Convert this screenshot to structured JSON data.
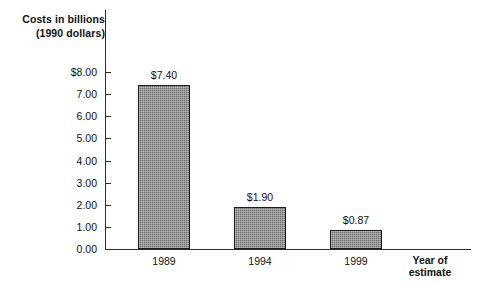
{
  "chart_data": {
    "type": "bar",
    "title": "",
    "ylabel": "Costs in billions (1990 dollars)",
    "ylabel_line1": "Costs in billions",
    "ylabel_line2": "(1990 dollars)",
    "xlabel": "Year of estimate",
    "xlabel_line1": "Year of",
    "xlabel_line2": "estimate",
    "categories": [
      "1989",
      "1994",
      "1999"
    ],
    "values": [
      7.4,
      1.9,
      0.87
    ],
    "value_labels": [
      "$7.40",
      "$1.90",
      "$0.87"
    ],
    "ylim": [
      0.0,
      8.0
    ],
    "ytick_labels": [
      "$8.00",
      "7.00",
      "6.00",
      "5.00",
      "4.00",
      "3.00",
      "2.00",
      "1.00",
      "0.00"
    ],
    "ytick_values": [
      8.0,
      7.0,
      6.0,
      5.0,
      4.0,
      3.0,
      2.0,
      1.0,
      0.0
    ],
    "grid": false,
    "legend": null,
    "bar_color": "#6f6f6f",
    "axis_color": "#2b2b2b",
    "background": "#ffffff"
  }
}
